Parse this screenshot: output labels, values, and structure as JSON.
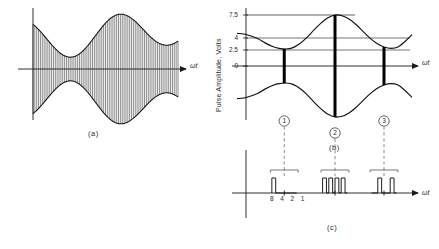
{
  "figure": {
    "captions": {
      "a": "(a)",
      "b": "(b)",
      "c": "(c)"
    },
    "axis_label_time": "ωt"
  },
  "panel_a": {
    "caption": "(a)",
    "x_axis_label": "ωt",
    "description": "amplitude-modulated carrier with dense vertical carrier lines inside envelope"
  },
  "panel_b": {
    "caption": "(b)",
    "x_axis_label": "ωt",
    "y_axis_label": "Pulse Amplitude, Volts",
    "y_ticks": [
      "7.5",
      "4",
      "2.5",
      "0"
    ],
    "sample_markers": [
      "1",
      "2",
      "3"
    ]
  },
  "panel_c": {
    "caption": "(c)",
    "x_axis_label": "ωt",
    "bit_weights": "8 4 2 1"
  },
  "chart_data": {
    "type": "line",
    "title": "",
    "xlabel": "ωt",
    "ylabel": "Pulse Amplitude, Volts",
    "ylim": [
      0,
      7.5
    ],
    "ytick_values": [
      7.5,
      4,
      2.5,
      0
    ],
    "ytick_labels": [
      "7.5",
      "4",
      "2.5",
      "0"
    ],
    "grid": true,
    "legend": "none",
    "series": [
      {
        "name": "upper envelope",
        "x": [
          0,
          4,
          8,
          12,
          16,
          20,
          24,
          28,
          32,
          36,
          40,
          44,
          48,
          52,
          56,
          60,
          64,
          68,
          72,
          76,
          80,
          84,
          88,
          92,
          96,
          100
        ],
        "y": [
          4.8,
          4.7,
          4.4,
          4.0,
          3.4,
          2.9,
          2.6,
          2.5,
          2.7,
          3.3,
          4.2,
          5.3,
          6.3,
          7.1,
          7.5,
          7.4,
          6.9,
          6.1,
          5.1,
          4.1,
          3.3,
          2.8,
          2.6,
          2.8,
          3.6,
          4.6
        ]
      },
      {
        "name": "lower envelope",
        "x": [
          0,
          4,
          8,
          12,
          16,
          20,
          24,
          28,
          32,
          36,
          40,
          44,
          48,
          52,
          56,
          60,
          64,
          68,
          72,
          76,
          80,
          84,
          88,
          92,
          96,
          100
        ],
        "y": [
          -4.8,
          -4.7,
          -4.4,
          -4.0,
          -3.4,
          -2.9,
          -2.6,
          -2.5,
          -2.7,
          -3.3,
          -4.2,
          -5.3,
          -6.3,
          -7.1,
          -7.5,
          -7.4,
          -6.9,
          -6.1,
          -5.1,
          -4.1,
          -3.3,
          -2.8,
          -2.6,
          -2.8,
          -3.6,
          -4.6
        ]
      }
    ],
    "samples": [
      {
        "label": "1",
        "x": 27,
        "amplitude": 4.0,
        "code": "1000",
        "bits": [
          1,
          0,
          0,
          0
        ]
      },
      {
        "label": "2",
        "x": 56,
        "amplitude": 7.5,
        "code": "1111",
        "bits": [
          1,
          1,
          1,
          1
        ]
      },
      {
        "label": "3",
        "x": 84,
        "amplitude": 2.5,
        "code": "0101",
        "bits": [
          0,
          1,
          0,
          1
        ]
      }
    ],
    "bit_weights": [
      8,
      4,
      2,
      1
    ]
  }
}
